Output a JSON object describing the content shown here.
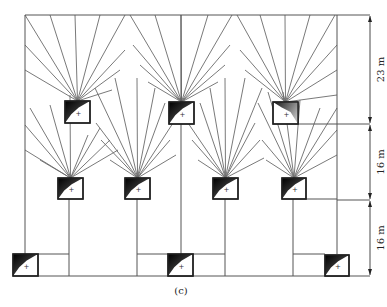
{
  "caption": "(c)",
  "dimensions": [
    {
      "label": "23 m",
      "y1": 15,
      "y2": 124
    },
    {
      "label": "16 m",
      "y1": 124,
      "y2": 200
    },
    {
      "label": "16 m",
      "y1": 200,
      "y2": 276
    }
  ],
  "frame": {
    "left": 25,
    "right": 337,
    "top": 15,
    "bottom": 276
  },
  "dimension_line_x": 370,
  "colors": {
    "line": "#555555",
    "ray": "#6a6a6a",
    "box_border": "#222222",
    "shade": "#111111"
  },
  "luminaires": [
    {
      "id": "top-1",
      "x": 65,
      "y": 101,
      "w": 25,
      "h": 22,
      "shade": "top-left",
      "rays_to": [
        [
          25,
          15
        ],
        [
          50,
          15
        ],
        [
          75,
          15
        ],
        [
          100,
          15
        ],
        [
          125,
          15
        ],
        [
          25,
          45
        ],
        [
          25,
          70
        ],
        [
          125,
          50
        ],
        [
          120,
          70
        ],
        [
          112,
          90
        ]
      ]
    },
    {
      "id": "top-2",
      "x": 169,
      "y": 102,
      "w": 25,
      "h": 22,
      "shade": "top-left",
      "rays_to": [
        [
          130,
          15
        ],
        [
          155,
          15
        ],
        [
          181,
          15
        ],
        [
          208,
          15
        ],
        [
          232,
          15
        ],
        [
          133,
          45
        ],
        [
          140,
          65
        ],
        [
          148,
          82
        ],
        [
          230,
          45
        ],
        [
          225,
          65
        ],
        [
          218,
          82
        ]
      ]
    },
    {
      "id": "top-3",
      "x": 273,
      "y": 102,
      "w": 25,
      "h": 22,
      "shade": "top-right",
      "rays_to": [
        [
          237,
          15
        ],
        [
          260,
          15
        ],
        [
          285,
          15
        ],
        [
          310,
          15
        ],
        [
          335,
          15
        ],
        [
          337,
          45
        ],
        [
          337,
          70
        ],
        [
          337,
          95
        ],
        [
          240,
          50
        ],
        [
          245,
          70
        ]
      ]
    },
    {
      "id": "mid-1",
      "x": 58,
      "y": 178,
      "w": 25,
      "h": 21,
      "shade": "top-left",
      "rays_to": [
        [
          25,
          125
        ],
        [
          25,
          150
        ],
        [
          50,
          105
        ],
        [
          70,
          95
        ],
        [
          88,
          135
        ],
        [
          100,
          128
        ],
        [
          110,
          140
        ],
        [
          118,
          150
        ],
        [
          30,
          108
        ],
        [
          40,
          160
        ]
      ]
    },
    {
      "id": "mid-2",
      "x": 125,
      "y": 178,
      "w": 25,
      "h": 21,
      "shade": "top-left",
      "rays_to": [
        [
          95,
          88
        ],
        [
          115,
          78
        ],
        [
          137,
          78
        ],
        [
          155,
          88
        ],
        [
          165,
          103
        ],
        [
          173,
          123
        ],
        [
          96,
          123
        ],
        [
          101,
          140
        ],
        [
          110,
          160
        ],
        [
          170,
          140
        ],
        [
          176,
          155
        ]
      ]
    },
    {
      "id": "mid-3",
      "x": 213,
      "y": 178,
      "w": 25,
      "h": 21,
      "shade": "top-left",
      "rays_to": [
        [
          188,
          123
        ],
        [
          192,
          140
        ],
        [
          198,
          160
        ],
        [
          200,
          103
        ],
        [
          210,
          88
        ],
        [
          225,
          78
        ],
        [
          245,
          78
        ],
        [
          262,
          88
        ],
        [
          255,
          123
        ],
        [
          260,
          140
        ],
        [
          264,
          158
        ]
      ]
    },
    {
      "id": "mid-4",
      "x": 282,
      "y": 178,
      "w": 24,
      "h": 21,
      "shade": "top-left",
      "rays_to": [
        [
          258,
          103
        ],
        [
          268,
          92
        ],
        [
          283,
          92
        ],
        [
          300,
          100
        ],
        [
          320,
          108
        ],
        [
          337,
          108
        ],
        [
          337,
          130
        ],
        [
          337,
          155
        ],
        [
          262,
          140
        ],
        [
          266,
          160
        ]
      ]
    },
    {
      "id": "bot-1",
      "x": 13,
      "y": 254,
      "w": 25,
      "h": 22,
      "shade": "top-left",
      "rays_to": []
    },
    {
      "id": "bot-2",
      "x": 168,
      "y": 254,
      "w": 25,
      "h": 22,
      "shade": "top-left",
      "rays_to": []
    },
    {
      "id": "bot-3",
      "x": 325,
      "y": 255,
      "w": 24,
      "h": 21,
      "shade": "top-left",
      "rays_to": []
    }
  ],
  "wires": [
    [
      25,
      15,
      337,
      15
    ],
    [
      25,
      15,
      25,
      254
    ],
    [
      337,
      15,
      337,
      254
    ],
    [
      181,
      15,
      181,
      254
    ],
    [
      38,
      276,
      337,
      276
    ],
    [
      38,
      254,
      69,
      254
    ],
    [
      69,
      199,
      69,
      276
    ],
    [
      137,
      199,
      137,
      276
    ],
    [
      137,
      254,
      168,
      254
    ],
    [
      193,
      254,
      225,
      254
    ],
    [
      225,
      199,
      225,
      276
    ],
    [
      293,
      199,
      293,
      276
    ],
    [
      293,
      254,
      325,
      254
    ],
    [
      306,
      199,
      337,
      199
    ],
    [
      298,
      124,
      370,
      124
    ],
    [
      337,
      200,
      370,
      200
    ],
    [
      337,
      276,
      370,
      276
    ],
    [
      337,
      15,
      370,
      15
    ]
  ]
}
